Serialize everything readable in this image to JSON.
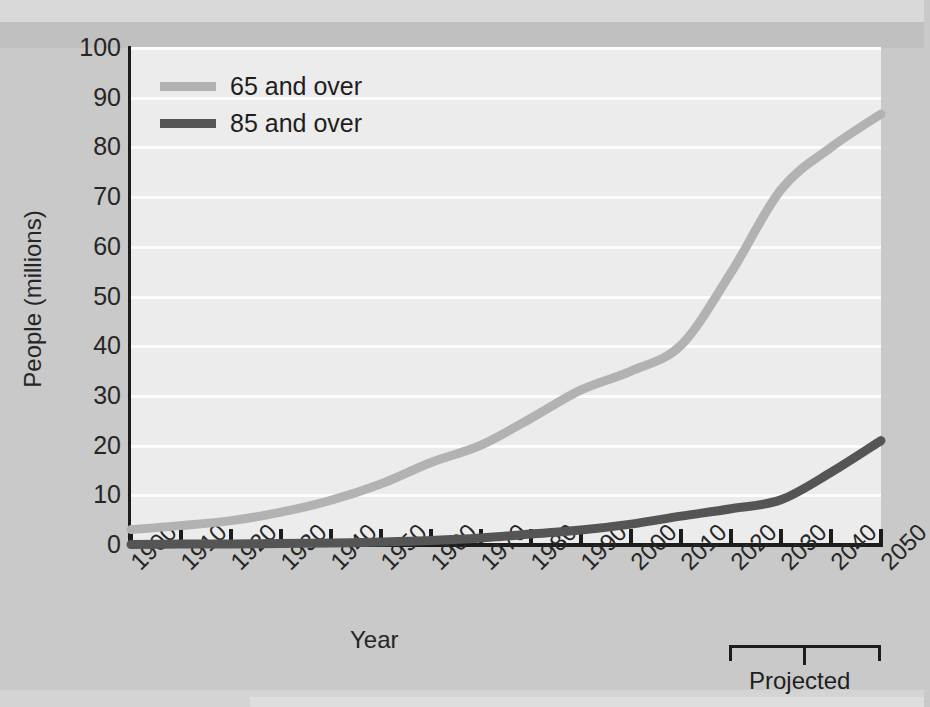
{
  "chart_data": {
    "type": "line",
    "title": "",
    "xlabel": "Year",
    "ylabel": "People (millions)",
    "xlim": [
      1900,
      2050
    ],
    "ylim": [
      0,
      100
    ],
    "grid": true,
    "legend_position": "top-left",
    "x": [
      1900,
      1910,
      1920,
      1930,
      1940,
      1950,
      1960,
      1970,
      1980,
      1990,
      2000,
      2010,
      2020,
      2030,
      2040,
      2050
    ],
    "xtick_labels": [
      "1900",
      "1910",
      "1920",
      "1930",
      "1940",
      "1950",
      "1960",
      "1970",
      "1980",
      "1990",
      "2000",
      "2010",
      "2020",
      "2030",
      "2040",
      "2050"
    ],
    "ytick_labels": [
      "0",
      "10",
      "20",
      "30",
      "40",
      "50",
      "60",
      "70",
      "80",
      "90",
      "100"
    ],
    "ytick_values": [
      0,
      10,
      20,
      30,
      40,
      50,
      60,
      70,
      80,
      90,
      100
    ],
    "series": [
      {
        "name": "65 and over",
        "color": "#b2b2b2",
        "values": [
          3.1,
          3.9,
          4.9,
          6.6,
          9.0,
          12.3,
          16.6,
          20.1,
          25.5,
          31.2,
          35.0,
          40.2,
          54.8,
          71.5,
          80.0,
          86.7
        ]
      },
      {
        "name": "85 and over",
        "color": "#555555",
        "values": [
          0.1,
          0.2,
          0.2,
          0.3,
          0.4,
          0.6,
          0.9,
          1.4,
          2.2,
          3.0,
          4.2,
          5.8,
          7.3,
          9.1,
          14.6,
          21.0
        ]
      }
    ],
    "annotations": [
      {
        "name": "projected-bracket",
        "label": "Projected",
        "from": 2020,
        "to": 2050
      }
    ]
  },
  "axis": {
    "ylabel_title": "People (millions)",
    "xlabel_title": "Year"
  },
  "legend": {
    "items": [
      {
        "label": "65 and over",
        "color": "#b2b2b2"
      },
      {
        "label": "85 and over",
        "color": "#555555"
      }
    ]
  },
  "annotation": {
    "projected": "Projected"
  }
}
